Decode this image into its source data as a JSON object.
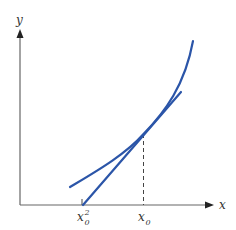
{
  "figure": {
    "axes": {
      "x_label": "x",
      "y_label": "y",
      "color": "#555555"
    },
    "labels": {
      "tick_left_base": "x",
      "tick_left_sub": "0",
      "tick_left_sup": "2",
      "tick_right_base": "x",
      "tick_right_sub": "0"
    },
    "curve": {
      "name": "function-curve",
      "color": "#2b55a8"
    },
    "tangent": {
      "name": "tangent-line",
      "color": "#2b55a8"
    },
    "dashed_guide": {
      "color": "#444444"
    }
  }
}
